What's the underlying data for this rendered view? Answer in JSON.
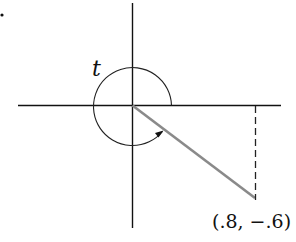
{
  "diagram": {
    "angle_label": "t",
    "point_label": "(.8, −.6)",
    "point": {
      "x": 0.8,
      "y": -0.6
    },
    "stray_mark": "·",
    "colors": {
      "axes": "#111111",
      "terminal_ray": "#8a8a8a",
      "arc": "#222222",
      "dashed": "#222222",
      "text": "#111111"
    },
    "elements": [
      "horizontal x-axis",
      "vertical y-axis",
      "circular arc with arrow indicating angle t (counterclockwise, nearly full turn)",
      "terminal ray from origin to (.8, −.6)",
      "dashed vertical line from point to x-axis"
    ]
  }
}
